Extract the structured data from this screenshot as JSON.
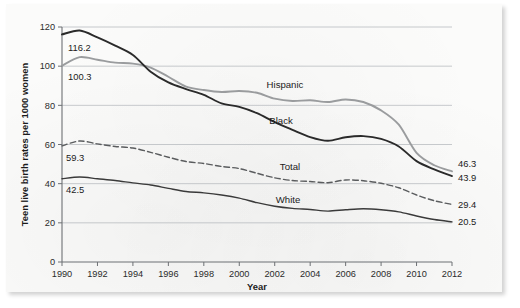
{
  "chart_data": {
    "type": "line",
    "title": "",
    "xlabel": "Year",
    "ylabel": "Teen live birth rates per 1000 women",
    "xlim": [
      1990,
      2012
    ],
    "ylim": [
      0,
      120
    ],
    "ytick_step": 20,
    "xtick_step": 2,
    "grid": true,
    "legend_position": "inline-labels-on-lines",
    "ytick_labels": [
      "0",
      "20",
      "40",
      "60",
      "80",
      "100",
      "120"
    ],
    "xtick_labels": [
      "1990",
      "1992",
      "1994",
      "1996",
      "1998",
      "2000",
      "2002",
      "2004",
      "2006",
      "2008",
      "2010",
      "2012"
    ],
    "x": [
      1990,
      1991,
      1992,
      1993,
      1994,
      1995,
      1996,
      1997,
      1998,
      1999,
      2000,
      2001,
      2002,
      2003,
      2004,
      2005,
      2006,
      2007,
      2008,
      2009,
      2010,
      2011,
      2012
    ],
    "series": [
      {
        "name": "Hispanic",
        "color": "#9a9c9e",
        "style": "solid",
        "label": "Hispanic",
        "start_value_label": "100.3",
        "end_value_label": "46.3",
        "values": [
          100.3,
          104.6,
          103.3,
          101.8,
          101.3,
          99.3,
          94.6,
          89.6,
          87.8,
          86.8,
          87.3,
          86.4,
          83.4,
          82.2,
          82.6,
          81.7,
          83.0,
          81.7,
          77.4,
          70.1,
          55.7,
          49.4,
          46.3
        ]
      },
      {
        "name": "Black",
        "color": "#2a2a2a",
        "style": "solid",
        "label": "Black",
        "start_value_label": "116.2",
        "end_value_label": "43.9",
        "values": [
          116.2,
          118.2,
          114.7,
          110.5,
          105.7,
          97.2,
          91.7,
          88.3,
          85.4,
          81.0,
          79.2,
          76.0,
          71.4,
          67.5,
          63.8,
          61.9,
          63.7,
          64.3,
          62.9,
          59.0,
          51.5,
          47.3,
          43.9
        ]
      },
      {
        "name": "Total",
        "color": "#5a5c5e",
        "style": "dashed",
        "label": "Total",
        "start_value_label": "59.3",
        "end_value_label": "29.4",
        "values": [
          59.3,
          61.8,
          60.3,
          59.0,
          58.2,
          56.0,
          53.5,
          51.3,
          50.3,
          48.8,
          47.7,
          45.3,
          43.0,
          41.6,
          41.1,
          40.5,
          41.9,
          41.5,
          40.2,
          37.9,
          34.2,
          31.3,
          29.4
        ]
      },
      {
        "name": "White",
        "color": "#3a3a3a",
        "style": "solid",
        "label": "White",
        "start_value_label": "42.5",
        "end_value_label": "20.5",
        "values": [
          42.5,
          43.4,
          42.5,
          41.6,
          40.4,
          39.3,
          37.6,
          36.0,
          35.3,
          34.2,
          32.6,
          30.3,
          28.5,
          27.4,
          26.8,
          26.0,
          26.7,
          27.2,
          26.7,
          25.6,
          23.5,
          21.7,
          20.5
        ]
      }
    ],
    "annotations": [
      {
        "text": "116.2",
        "series": "Black",
        "position": "start"
      },
      {
        "text": "100.3",
        "series": "Hispanic",
        "position": "start"
      },
      {
        "text": "59.3",
        "series": "Total",
        "position": "start"
      },
      {
        "text": "42.5",
        "series": "White",
        "position": "start"
      },
      {
        "text": "46.3",
        "series": "Hispanic",
        "position": "end"
      },
      {
        "text": "43.9",
        "series": "Black",
        "position": "end"
      },
      {
        "text": "29.4",
        "series": "Total",
        "position": "end"
      },
      {
        "text": "20.5",
        "series": "White",
        "position": "end"
      }
    ]
  }
}
